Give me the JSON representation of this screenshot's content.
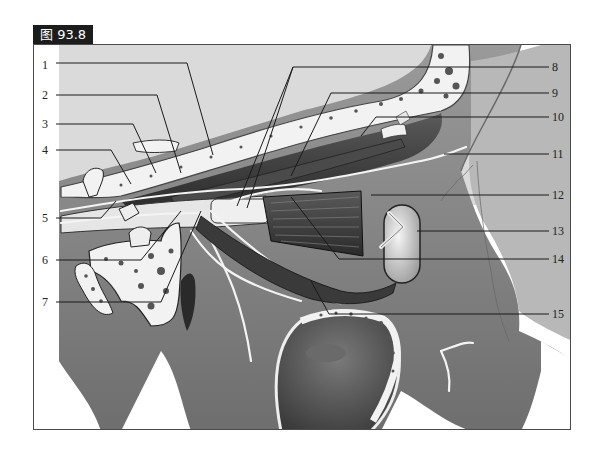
{
  "figure": {
    "tag": "图 93.8"
  },
  "labels": {
    "left": [
      {
        "num": "1",
        "y": 64
      },
      {
        "num": "2",
        "y": 94
      },
      {
        "num": "3",
        "y": 123
      },
      {
        "num": "4",
        "y": 149
      },
      {
        "num": "5",
        "y": 217
      },
      {
        "num": "6",
        "y": 259
      },
      {
        "num": "7",
        "y": 301
      }
    ],
    "right": [
      {
        "num": "8",
        "y": 66
      },
      {
        "num": "9",
        "y": 92
      },
      {
        "num": "10",
        "y": 116
      },
      {
        "num": "11",
        "y": 153
      },
      {
        "num": "12",
        "y": 194
      },
      {
        "num": "13",
        "y": 230
      },
      {
        "num": "14",
        "y": 258
      },
      {
        "num": "15",
        "y": 313
      }
    ]
  },
  "colors": {
    "frame": "#4a4a4a",
    "tag_bg": "#1c1c1c",
    "tissue_light": "#d8d8d8",
    "tissue_mid": "#8a8a8a",
    "tissue_dark": "#3a3a3a",
    "bone": "#f2f2f2"
  }
}
